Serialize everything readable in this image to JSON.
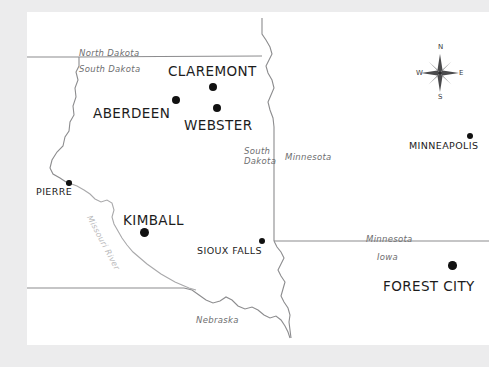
{
  "map": {
    "title": "Regional map of the Upper Midwest",
    "background_color": "#ececed",
    "canvas_color": "#ffffff",
    "border_color": "#8c8c8e",
    "dot_color": "#111111",
    "label_color": "#1c1c1c",
    "state_label_color": "#6e6e70",
    "river_label_color": "#b9b9bb",
    "cities": [
      {
        "name": "CLAREMONT",
        "dot_size": "large",
        "dot_x": 213,
        "dot_y": 87,
        "label_x": 168,
        "label_y": 63
      },
      {
        "name": "ABERDEEN",
        "dot_size": "large",
        "dot_x": 176,
        "dot_y": 100,
        "label_x": 93,
        "label_y": 105
      },
      {
        "name": "WEBSTER",
        "dot_size": "large",
        "dot_x": 217,
        "dot_y": 108,
        "label_x": 184,
        "label_y": 117
      },
      {
        "name": "MINNEAPOLIS",
        "dot_size": "small",
        "dot_x": 470,
        "dot_y": 136,
        "label_x": 409,
        "label_y": 140
      },
      {
        "name": "PIERRE",
        "dot_size": "small",
        "dot_x": 69,
        "dot_y": 183,
        "label_x": 36,
        "label_y": 186
      },
      {
        "name": "KIMBALL",
        "dot_size": "large",
        "dot_x": 144,
        "dot_y": 232,
        "label_x": 123,
        "label_y": 212
      },
      {
        "name": "SIOUX FALLS",
        "dot_size": "small",
        "dot_x": 262,
        "dot_y": 241,
        "label_x": 197,
        "label_y": 245
      },
      {
        "name": "FOREST CITY",
        "dot_size": "large",
        "dot_x": 452,
        "dot_y": 265,
        "label_x": 383,
        "label_y": 278
      }
    ],
    "state_labels": [
      {
        "name": "North Dakota",
        "x": 79,
        "y": 48
      },
      {
        "name": "South Dakota",
        "x": 79,
        "y": 64
      },
      {
        "name": "South\nDakota",
        "x": 265,
        "y": 147,
        "two_line": true
      },
      {
        "name": "Minnesota",
        "x": 287,
        "y": 152
      },
      {
        "name": "Minnesota",
        "x": 366,
        "y": 234
      },
      {
        "name": "Iowa",
        "x": 377,
        "y": 252
      },
      {
        "name": "Nebraska",
        "x": 196,
        "y": 315
      }
    ],
    "river_labels": [
      {
        "name": "Missouri River",
        "x": 93,
        "y": 218,
        "rotation": 62
      }
    ],
    "compass": {
      "name": "compass-rose",
      "center_x": 440,
      "center_y": 73,
      "north": "N",
      "east": "E",
      "south": "S",
      "west": "W"
    }
  }
}
